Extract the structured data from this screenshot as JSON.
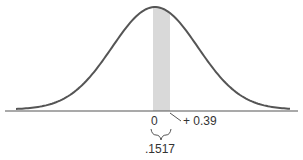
{
  "chart_data": {
    "type": "area",
    "title": "",
    "distribution": "standard normal",
    "shaded_region": {
      "from": 0,
      "to": 0.39,
      "area": 0.1517
    },
    "xlabel": "",
    "ylabel": "",
    "tick_labels": [
      "0",
      "+ 0.39"
    ],
    "annotations": [
      ".1517"
    ],
    "grid": false
  },
  "labels": {
    "zero": "0",
    "z_value": "+ 0.39",
    "area": ".1517"
  },
  "colors": {
    "curve": "#555555",
    "shade": "#d9d9d9",
    "axis": "#555555"
  }
}
